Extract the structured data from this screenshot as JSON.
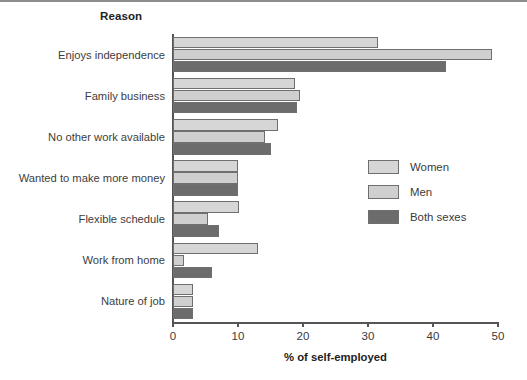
{
  "chart_data": {
    "type": "bar",
    "orientation": "horizontal",
    "title": "",
    "xlabel": "% of self-employed",
    "ylabel": "Reason",
    "xlim": [
      0,
      50
    ],
    "xticks": [
      0,
      10,
      20,
      30,
      40,
      50
    ],
    "xtick_labels": [
      "0",
      "10",
      "20",
      "30",
      "40",
      "50"
    ],
    "grid": false,
    "legend_position": "center-right",
    "categories": [
      "Enjoys independence",
      "Family business",
      "No other work available",
      "Wanted to make more money",
      "Flexible schedule",
      "Work from home",
      "Nature of job"
    ],
    "series": [
      {
        "name": "Women",
        "color": "#d6d6d6",
        "values": [
          31.5,
          18.8,
          16.2,
          10.0,
          10.2,
          13.0,
          3.0
        ]
      },
      {
        "name": "Men",
        "color": "#cfcfcf",
        "values": [
          49.0,
          19.6,
          14.2,
          10.0,
          5.4,
          1.7,
          3.0
        ]
      },
      {
        "name": "Both sexes",
        "color": "#6c6c6c",
        "values": [
          42.0,
          19.1,
          15.0,
          10.0,
          7.0,
          6.0,
          3.0
        ]
      }
    ]
  },
  "legend": {
    "items": [
      {
        "label": "Women"
      },
      {
        "label": "Men"
      },
      {
        "label": "Both sexes"
      }
    ]
  },
  "colors": {
    "women": "#d6d6d6",
    "men": "#cfcfcf",
    "both": "#6c6c6c",
    "bar_border": "#6f6f6f",
    "axis": "#555555",
    "text": "#3a3a3a"
  }
}
